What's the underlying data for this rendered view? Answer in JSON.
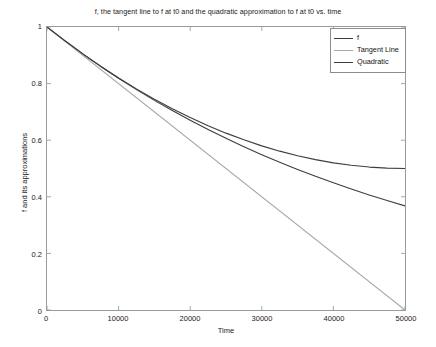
{
  "chart_data": {
    "type": "line",
    "title": "f, the tangent line to f at t0 and the quadratic approximation to f at t0 vs. time",
    "xlabel": "Time",
    "ylabel": "f and its approximations",
    "xlim": [
      0,
      50000
    ],
    "ylim": [
      0,
      1
    ],
    "xticks": [
      0,
      10000,
      20000,
      30000,
      40000,
      50000
    ],
    "xtick_labels": [
      "0",
      "10000",
      "20000",
      "30000",
      "40000",
      "50000"
    ],
    "yticks": [
      0,
      0.2,
      0.4,
      0.6,
      0.8,
      1
    ],
    "ytick_labels": [
      "0",
      "0.2",
      "0.4",
      "0.6",
      "0.8",
      "1"
    ],
    "grid": false,
    "legend_position": "upper right",
    "series": [
      {
        "name": "f",
        "color": "#3d3d3d",
        "x": [
          0,
          2500,
          5000,
          7500,
          10000,
          12500,
          15000,
          17500,
          20000,
          22500,
          25000,
          27500,
          30000,
          32500,
          35000,
          37500,
          40000,
          42500,
          45000,
          47500,
          50000
        ],
        "values": [
          1.0,
          0.9512,
          0.9048,
          0.8607,
          0.8187,
          0.7788,
          0.7408,
          0.7047,
          0.6703,
          0.6376,
          0.6065,
          0.5769,
          0.5488,
          0.522,
          0.4966,
          0.4724,
          0.4493,
          0.4274,
          0.4066,
          0.3867,
          0.3679
        ]
      },
      {
        "name": "Tangent Line",
        "color": "#a8a8a8",
        "x": [
          0,
          50000
        ],
        "values": [
          1.0,
          0.0
        ]
      },
      {
        "name": "Quadratic",
        "color": "#3d3d3d",
        "x": [
          0,
          2500,
          5000,
          7500,
          10000,
          12500,
          15000,
          17500,
          20000,
          22500,
          25000,
          27500,
          30000,
          32500,
          35000,
          37500,
          40000,
          42500,
          45000,
          47500,
          50000
        ],
        "values": [
          1.0,
          0.9513,
          0.905,
          0.8613,
          0.82,
          0.7813,
          0.745,
          0.7113,
          0.68,
          0.6513,
          0.625,
          0.6013,
          0.58,
          0.5613,
          0.545,
          0.5313,
          0.52,
          0.5113,
          0.505,
          0.5013,
          0.5
        ]
      }
    ]
  },
  "legend": {
    "entries": [
      {
        "label": "f"
      },
      {
        "label": "Tangent Line"
      },
      {
        "label": "Quadratic"
      }
    ]
  }
}
